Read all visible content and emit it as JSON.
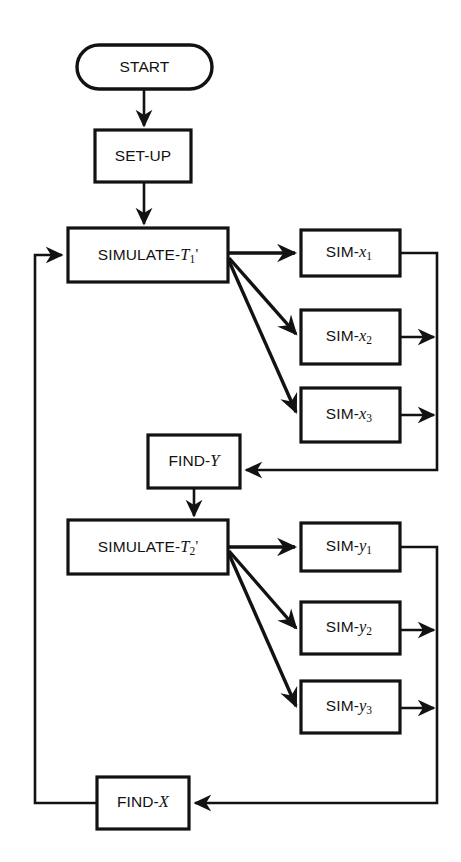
{
  "diagram": {
    "type": "flowchart",
    "background_color": "#ffffff",
    "line_color": "#121212",
    "nodes": [
      {
        "id": "start",
        "shape": "terminator",
        "label": "START",
        "x": 77,
        "y": 45,
        "w": 135,
        "h": 44
      },
      {
        "id": "setup",
        "shape": "process",
        "label": "SET-UP",
        "x": 95,
        "y": 130,
        "w": 96,
        "h": 52
      },
      {
        "id": "sim_t1",
        "shape": "process",
        "label_prefix": "SIMULATE-",
        "label_var": "T",
        "label_sub": "1",
        "label_prime": "'",
        "x": 68,
        "y": 228,
        "w": 160,
        "h": 54
      },
      {
        "id": "sim_x1",
        "shape": "process",
        "label_prefix": "SIM-",
        "label_var": "x",
        "label_sub": "1",
        "x": 301,
        "y": 230,
        "w": 99,
        "h": 46
      },
      {
        "id": "sim_x2",
        "shape": "process",
        "label_prefix": "SIM-",
        "label_var": "x",
        "label_sub": "2",
        "x": 301,
        "y": 310,
        "w": 99,
        "h": 54
      },
      {
        "id": "sim_x3",
        "shape": "process",
        "label_prefix": "SIM-",
        "label_var": "x",
        "label_sub": "3",
        "x": 301,
        "y": 388,
        "w": 99,
        "h": 54
      },
      {
        "id": "find_y",
        "shape": "process",
        "label_prefix": "FIND-",
        "label_var": "Y",
        "x": 148,
        "y": 435,
        "w": 92,
        "h": 53
      },
      {
        "id": "sim_t2",
        "shape": "process",
        "label_prefix": "SIMULATE-",
        "label_var": "T",
        "label_sub": "2",
        "label_prime": "'",
        "x": 68,
        "y": 520,
        "w": 160,
        "h": 54
      },
      {
        "id": "sim_y1",
        "shape": "process",
        "label_prefix": "SIM-",
        "label_var": "y",
        "label_sub": "1",
        "x": 301,
        "y": 523,
        "w": 99,
        "h": 48
      },
      {
        "id": "sim_y2",
        "shape": "process",
        "label_prefix": "SIM-",
        "label_var": "y",
        "label_sub": "2",
        "x": 301,
        "y": 602,
        "w": 99,
        "h": 52
      },
      {
        "id": "sim_y3",
        "shape": "process",
        "label_prefix": "SIM-",
        "label_var": "y",
        "label_sub": "3",
        "x": 301,
        "y": 681,
        "w": 99,
        "h": 52
      },
      {
        "id": "find_x",
        "shape": "process",
        "label_prefix": "FIND-",
        "label_var": "X",
        "x": 97,
        "y": 777,
        "w": 92,
        "h": 52
      }
    ],
    "edges": [
      {
        "id": "start-to-setup",
        "from": "start",
        "to": "setup",
        "arrow": true,
        "style": "straight-down"
      },
      {
        "id": "setup-to-simt1",
        "from": "setup",
        "to": "sim_t1",
        "arrow": true,
        "style": "straight-down"
      },
      {
        "id": "simt1-to-simx1",
        "from": "sim_t1",
        "to": "sim_x1",
        "arrow": true,
        "style": "fan"
      },
      {
        "id": "simt1-to-simx2",
        "from": "sim_t1",
        "to": "sim_x2",
        "arrow": true,
        "style": "fan"
      },
      {
        "id": "simt1-to-simx3",
        "from": "sim_t1",
        "to": "sim_x3",
        "arrow": true,
        "style": "fan"
      },
      {
        "id": "simx1-to-bus",
        "from": "sim_x1",
        "to": "bus_x",
        "arrow": false,
        "style": "elbow"
      },
      {
        "id": "simx2-to-bus",
        "from": "sim_x2",
        "to": "bus_x",
        "arrow": true,
        "style": "straight-right"
      },
      {
        "id": "simx3-to-bus",
        "from": "sim_x3",
        "to": "bus_x",
        "arrow": true,
        "style": "straight-right"
      },
      {
        "id": "busx-to-findy",
        "from": "bus_x",
        "to": "find_y",
        "arrow": true,
        "style": "elbow-left"
      },
      {
        "id": "findy-to-simt2",
        "from": "find_y",
        "to": "sim_t2",
        "arrow": true,
        "style": "straight-down"
      },
      {
        "id": "simt2-to-simy1",
        "from": "sim_t2",
        "to": "sim_y1",
        "arrow": true,
        "style": "fan"
      },
      {
        "id": "simt2-to-simy2",
        "from": "sim_t2",
        "to": "sim_y2",
        "arrow": true,
        "style": "fan"
      },
      {
        "id": "simt2-to-simy3",
        "from": "sim_t2",
        "to": "sim_y3",
        "arrow": true,
        "style": "fan"
      },
      {
        "id": "simy1-to-bus",
        "from": "sim_y1",
        "to": "bus_y",
        "arrow": false,
        "style": "elbow"
      },
      {
        "id": "simy2-to-bus",
        "from": "sim_y2",
        "to": "bus_y",
        "arrow": true,
        "style": "straight-right"
      },
      {
        "id": "simy3-to-bus",
        "from": "sim_y3",
        "to": "bus_y",
        "arrow": true,
        "style": "straight-right"
      },
      {
        "id": "busy-to-findx",
        "from": "bus_y",
        "to": "find_x",
        "arrow": true,
        "style": "elbow-left"
      },
      {
        "id": "findx-to-simt1",
        "from": "find_x",
        "to": "sim_t1",
        "arrow": true,
        "style": "feedback-left"
      }
    ]
  },
  "labels": {
    "start": "START",
    "setup": "SET-UP",
    "simulate_t1": "SIMULATE-T1'",
    "simulate_t2": "SIMULATE-T2'",
    "sim_x1": "SIM-x1",
    "sim_x2": "SIM-x2",
    "sim_x3": "SIM-x3",
    "sim_y1": "SIM-y1",
    "sim_y2": "SIM-y2",
    "sim_y3": "SIM-y3",
    "find_y": "FIND-Y",
    "find_x": "FIND-X",
    "prefix_simulate": "SIMULATE-",
    "prefix_sim": "SIM-",
    "prefix_find": "FIND-",
    "var_T": "T",
    "var_x": "x",
    "var_y": "y",
    "var_X": "X",
    "var_Y": "Y",
    "sub_1": "1",
    "sub_2": "2",
    "sub_3": "3",
    "prime": "'"
  }
}
